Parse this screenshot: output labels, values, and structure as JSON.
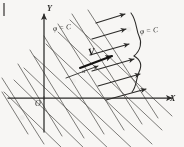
{
  "figure": {
    "caption_none": "",
    "axes": {
      "y_label": "Y",
      "x_label": "X",
      "origin_label": "O"
    },
    "labels": {
      "level_curve_left": "φ = C",
      "level_curve_right": "φ = C",
      "vector_label": "V",
      "angle_label": "α"
    },
    "colors": {
      "ink": "#2b2a28",
      "ink_bold": "#141312",
      "paper": "#f7f6f4",
      "grid_line": "#5a5855"
    },
    "geometry": {
      "origin_x": 44,
      "origin_y": 98,
      "grid_rotation_deg": -28,
      "family_a_count": 7,
      "family_b_count": 8,
      "arrow_count": 6,
      "arrow_direction_deg": -28
    }
  }
}
